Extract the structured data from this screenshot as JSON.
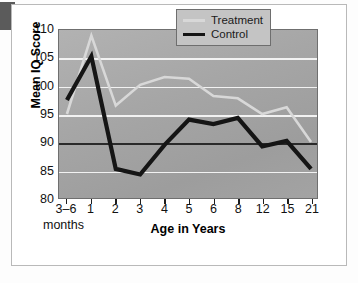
{
  "chart_data": {
    "type": "line",
    "title": "",
    "xlabel": "Age in Years",
    "ylabel": "Mean IQ Score",
    "xlabel_secondary": "months",
    "categories": [
      "3–6",
      "1",
      "2",
      "3",
      "4",
      "5",
      "6",
      "8",
      "12",
      "15",
      "21"
    ],
    "ylim": [
      80,
      110
    ],
    "yticks": [
      110,
      105,
      100,
      95,
      90,
      85,
      80
    ],
    "grid": true,
    "grid_color": "#f2f2f2",
    "reference_line": 90,
    "reference_line_color": "#2a2a2a",
    "legend_position": "top-right",
    "plot_background": "#a8a8a8",
    "series": [
      {
        "name": "Treatment",
        "color": "#d8d8d8",
        "values": [
          95.0,
          109.0,
          96.5,
          100.2,
          101.6,
          101.3,
          98.2,
          97.8,
          95.0,
          96.2,
          90.0
        ]
      },
      {
        "name": "Control",
        "color": "#151515",
        "values": [
          97.5,
          105.3,
          85.2,
          84.2,
          89.5,
          94.0,
          93.2,
          94.3,
          89.2,
          90.2,
          85.2
        ]
      }
    ]
  },
  "legend": {
    "items": [
      {
        "label": "Treatment"
      },
      {
        "label": "Control"
      }
    ]
  }
}
